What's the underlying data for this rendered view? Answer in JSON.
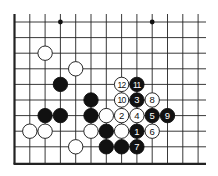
{
  "board": {
    "origin_x": 14.5,
    "origin_y": 22,
    "col_spacing": 15.3,
    "row_spacing": 15.6,
    "cols": 13,
    "rows": 10,
    "right_extend": 206,
    "left_edge": true,
    "bottom_edge": true,
    "line_color": "#222222",
    "star_points": [
      [
        3,
        0
      ],
      [
        9,
        0
      ]
    ]
  },
  "stones": [
    {
      "color": "white",
      "col": 2,
      "row": 2
    },
    {
      "color": "white",
      "col": 4,
      "row": 3
    },
    {
      "color": "black",
      "col": 3,
      "row": 4
    },
    {
      "color": "black",
      "col": 5,
      "row": 5
    },
    {
      "color": "black",
      "col": 2,
      "row": 6
    },
    {
      "color": "black",
      "col": 3,
      "row": 6
    },
    {
      "color": "black",
      "col": 5,
      "row": 6
    },
    {
      "color": "white",
      "col": 6,
      "row": 6
    },
    {
      "color": "white",
      "col": 1,
      "row": 7
    },
    {
      "color": "white",
      "col": 2,
      "row": 7
    },
    {
      "color": "white",
      "col": 5,
      "row": 7
    },
    {
      "color": "black",
      "col": 6,
      "row": 7
    },
    {
      "color": "white",
      "col": 7,
      "row": 7
    },
    {
      "color": "white",
      "col": 4,
      "row": 8
    },
    {
      "color": "black",
      "col": 6,
      "row": 8
    },
    {
      "color": "black",
      "col": 7,
      "row": 8
    }
  ],
  "moves": [
    {
      "label": "1",
      "color": "black",
      "col": 8,
      "row": 7
    },
    {
      "label": "2",
      "color": "white",
      "col": 7,
      "row": 6
    },
    {
      "label": "3",
      "color": "black",
      "col": 8,
      "row": 5
    },
    {
      "label": "4",
      "color": "white",
      "col": 8,
      "row": 6
    },
    {
      "label": "5",
      "color": "black",
      "col": 9,
      "row": 6
    },
    {
      "label": "6",
      "color": "white",
      "col": 9,
      "row": 7
    },
    {
      "label": "7",
      "color": "black",
      "col": 8,
      "row": 8
    },
    {
      "label": "8",
      "color": "white",
      "col": 9,
      "row": 5
    },
    {
      "label": "9",
      "color": "black",
      "col": 10,
      "row": 6
    },
    {
      "label": "10",
      "color": "white",
      "col": 7,
      "row": 5
    },
    {
      "label": "11",
      "color": "black",
      "col": 8,
      "row": 4
    },
    {
      "label": "12",
      "color": "white",
      "col": 7,
      "row": 4
    }
  ]
}
